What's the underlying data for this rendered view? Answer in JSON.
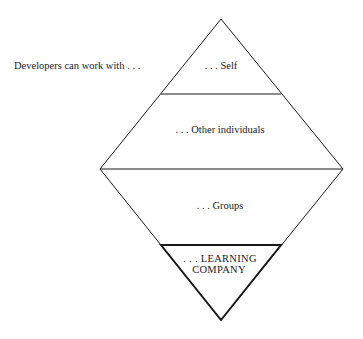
{
  "diagram": {
    "intro_label": "Developers can work with . . .",
    "levels": [
      {
        "label": ". . . Self"
      },
      {
        "label": ". . . Other individuals"
      },
      {
        "label": ". . . Groups"
      },
      {
        "label_line1": ". . . LEARNING",
        "label_line2": "COMPANY"
      }
    ],
    "colors": {
      "line": "#1a1a1a",
      "background": "#ffffff"
    }
  }
}
